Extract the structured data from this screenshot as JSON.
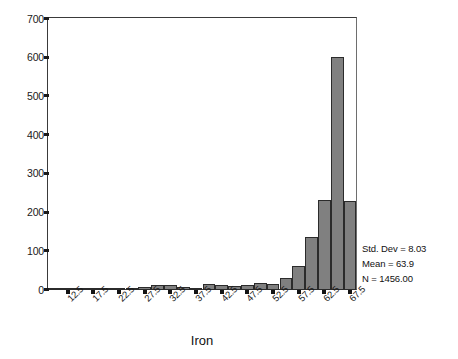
{
  "chart_data": {
    "type": "bar",
    "title": "",
    "subtitle": "",
    "xlabel": "Iron",
    "ylabel": "",
    "grid": false,
    "legend": "none",
    "ylim": [
      0,
      700
    ],
    "xlim": [
      10,
      70
    ],
    "bin_width": 2.5,
    "y_ticks": [
      "0",
      "100",
      "200",
      "300",
      "400",
      "500",
      "600",
      "700"
    ],
    "y_tick_values": [
      0,
      100,
      200,
      300,
      400,
      500,
      600,
      700
    ],
    "x_ticks": [
      "12.5",
      "17.5",
      "22.5",
      "27.5",
      "32.5",
      "37.5",
      "42.5",
      "47.5",
      "52.5",
      "57.5",
      "62.5",
      "67.5"
    ],
    "x_tick_values": [
      12.5,
      17.5,
      22.5,
      27.5,
      32.5,
      37.5,
      42.5,
      47.5,
      52.5,
      57.5,
      62.5,
      67.5
    ],
    "bin_centers": [
      11.25,
      13.75,
      16.25,
      18.75,
      21.25,
      23.75,
      26.25,
      28.75,
      31.25,
      33.75,
      36.25,
      38.75,
      41.25,
      43.75,
      46.25,
      48.75,
      51.25,
      53.75,
      56.25,
      58.75,
      61.25,
      63.75,
      66.25,
      68.75
    ],
    "values": [
      1,
      1,
      1,
      1,
      1,
      2,
      2,
      6,
      12,
      12,
      7,
      5,
      13,
      12,
      8,
      12,
      18,
      14,
      30,
      60,
      135,
      230,
      600,
      228
    ],
    "bar_color": "#808080",
    "bar_edge_color": "#2b2b2b",
    "axis_color": "#3a3a3a"
  },
  "statistics": {
    "std_dev_label": "Std. Dev = 8.03",
    "mean_label": "Mean = 63.9",
    "n_label": "N = 1456.00"
  },
  "axes": {
    "x_title": "Iron"
  }
}
